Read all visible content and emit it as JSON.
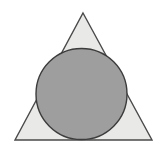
{
  "figure": {
    "canvas": {
      "width": 164,
      "height": 158,
      "background_color": "#ffffff"
    },
    "shapes": [
      {
        "id": "triangle",
        "name": "outer-triangle",
        "type": "polygon",
        "label": "Triangle",
        "points": "83,13 152,140 15,140",
        "vertices": [
          {
            "label": "apex",
            "x": 83,
            "y": 13
          },
          {
            "label": "bottom-right",
            "x": 152,
            "y": 140
          },
          {
            "label": "bottom-left",
            "x": 15,
            "y": 140
          }
        ],
        "fill_color": "#e9e9e7",
        "stroke_color": "#4a4a4a",
        "stroke_width": 1.4
      },
      {
        "id": "circle",
        "name": "inscribed-circle",
        "type": "circle",
        "label": "Inscribed circle",
        "center_x": 81.5,
        "center_y": 94,
        "radius": 45.5,
        "fill_color": "#9e9e9e",
        "stroke_color": "#3c3c3c",
        "stroke_width": 1.4
      }
    ]
  }
}
